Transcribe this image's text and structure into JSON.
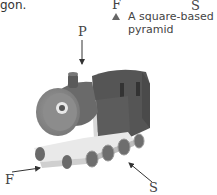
{
  "question": {
    "fragment_text": "gon.",
    "top_labels": {
      "left": "F",
      "right": "S"
    },
    "option": {
      "marker": "triangle",
      "text_line1": "A square-based",
      "text_line2": "pyramid"
    }
  },
  "figure": {
    "view_labels": {
      "plan": "P",
      "front": "F",
      "side": "S"
    },
    "colors": {
      "body": "#5a5a5a",
      "boiler_face": "#8a8a8a",
      "base": "#e6e6e6",
      "wheel": "#6e6e6e",
      "arrow": "#333333"
    }
  }
}
